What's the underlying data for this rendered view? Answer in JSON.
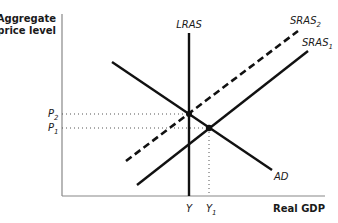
{
  "diagram": {
    "type": "AD-AS model",
    "y_axis_title_line1": "Aggregate",
    "y_axis_title_line2": "price level",
    "x_axis_title": "Real GDP",
    "curves": {
      "lras": {
        "label": "LRAS"
      },
      "sras2": {
        "label": "SRAS",
        "sub": "2",
        "style": "dashed"
      },
      "sras1": {
        "label": "SRAS",
        "sub": "1",
        "style": "solid"
      },
      "ad": {
        "label": "AD"
      }
    },
    "price_levels": {
      "p2": {
        "label": "P",
        "sub": "2"
      },
      "p1": {
        "label": "P",
        "sub": "1"
      }
    },
    "outputs": {
      "y": {
        "label": "Y"
      },
      "y1": {
        "label": "Y",
        "sub": "1"
      }
    },
    "colors": {
      "line": "#111111",
      "axis": "#888888",
      "text": "#1a1a1a"
    }
  }
}
